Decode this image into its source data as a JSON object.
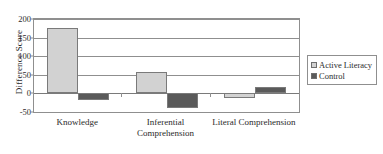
{
  "chart_data": {
    "type": "bar",
    "title": "",
    "xlabel": "",
    "ylabel": "Difference Score",
    "categories": [
      "Knowledge",
      "Inferential\nComprehension",
      "Literal Comprehension"
    ],
    "series": [
      {
        "name": "Active Literacy",
        "color": "#d2d2d2",
        "values": [
          175,
          58,
          -13
        ]
      },
      {
        "name": "Control",
        "color": "#5a5a5a",
        "values": [
          -18,
          -38,
          17
        ]
      }
    ],
    "ylim": [
      -50,
      200
    ],
    "yticks": [
      200,
      150,
      100,
      50,
      0,
      -50
    ],
    "ytick_labels": [
      "200",
      "150",
      "100",
      "50",
      "0",
      "-50"
    ],
    "grid": true,
    "legend_position": "right"
  }
}
